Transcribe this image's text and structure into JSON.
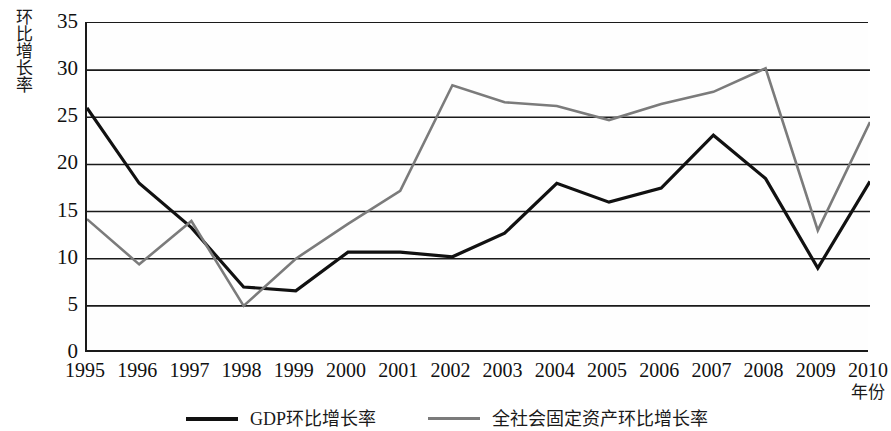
{
  "chart_data": {
    "type": "line",
    "title": "",
    "xlabel": "年份",
    "ylabel": "环比增长率",
    "x": [
      1995,
      1996,
      1997,
      1998,
      1999,
      2000,
      2001,
      2002,
      2003,
      2004,
      2005,
      2006,
      2007,
      2008,
      2009,
      2010
    ],
    "categories": [
      "1995",
      "1996",
      "1997",
      "1998",
      "1999",
      "2000",
      "2001",
      "2002",
      "2003",
      "2004",
      "2005",
      "2006",
      "2007",
      "2008",
      "2009",
      "2010"
    ],
    "xlim": [
      1995,
      2010
    ],
    "ylim": [
      0,
      35
    ],
    "yticks": [
      0,
      5,
      10,
      15,
      20,
      25,
      30,
      35
    ],
    "ytick_labels": [
      "0",
      "5",
      "10",
      "15",
      "20",
      "25",
      "30",
      "35"
    ],
    "grid": "horizontal",
    "legend_position": "bottom",
    "series": [
      {
        "name": "GDP环比增长率",
        "color": "#111111",
        "width": 3.2,
        "values": [
          26.0,
          18.0,
          13.3,
          7.0,
          6.6,
          10.7,
          10.7,
          10.2,
          12.7,
          18.0,
          16.0,
          17.5,
          23.1,
          18.5,
          9.0,
          18.2
        ]
      },
      {
        "name": "全社会固定资产环比增长率",
        "color": "#7b7b7b",
        "width": 2.6,
        "values": [
          14.2,
          9.4,
          14.0,
          5.0,
          10.0,
          13.7,
          17.2,
          28.4,
          26.6,
          26.2,
          24.7,
          26.4,
          27.7,
          30.2,
          13.0,
          24.5
        ]
      }
    ]
  },
  "legend": {
    "items": [
      {
        "label": "GDP环比增长率",
        "style": "thick"
      },
      {
        "label": "全社会固定资产环比增长率",
        "style": "thin"
      }
    ]
  }
}
